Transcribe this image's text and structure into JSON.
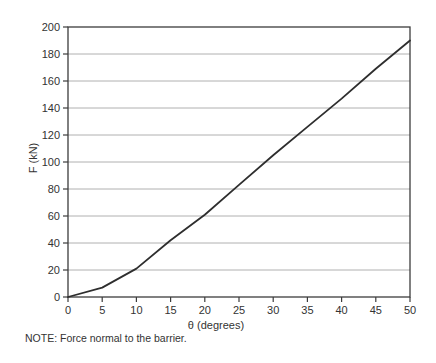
{
  "figure": {
    "note": "NOTE: Force normal to the barrier."
  },
  "chart_data": {
    "type": "line",
    "title": "",
    "xlabel": "θ (degrees)",
    "ylabel": "F (kN)",
    "x": [
      0,
      5,
      10,
      15,
      20,
      25,
      30,
      35,
      40,
      45,
      50
    ],
    "series": [
      {
        "name": "force-normal-to-barrier",
        "values": [
          0,
          7,
          21,
          42,
          61,
          83,
          105,
          126,
          147,
          169,
          190
        ]
      }
    ],
    "xlim": [
      0,
      50
    ],
    "ylim": [
      0,
      200
    ],
    "x_ticks": [
      "0",
      "5",
      "10",
      "15",
      "20",
      "25",
      "30",
      "35",
      "40",
      "45",
      "50"
    ],
    "y_ticks": [
      "0",
      "20",
      "40",
      "60",
      "80",
      "100",
      "120",
      "140",
      "160",
      "180",
      "200"
    ],
    "grid": "horizontal-only",
    "legend": "none",
    "colors": {
      "line": "#2e2e2e",
      "grid": "#b0b0b0",
      "axis": "#3c3c3c",
      "text": "#333333",
      "background": "#ffffff"
    }
  }
}
